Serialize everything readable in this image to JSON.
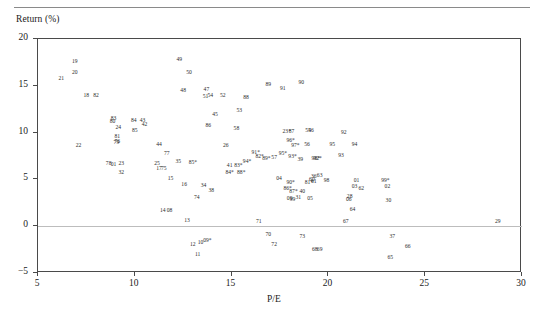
{
  "figure": {
    "axis_label_y": "Return (%)",
    "axis_label_x": "P/E"
  },
  "chart_data": {
    "type": "scatter",
    "title": "",
    "xlabel": "P/E",
    "ylabel": "Return (%)",
    "xlim": [
      5,
      30
    ],
    "ylim": [
      -5,
      20
    ],
    "xticks": [
      "5",
      "10",
      "15",
      "20",
      "25",
      "30"
    ],
    "yticks": [
      "20",
      "15",
      "10",
      "5",
      "0",
      "-5"
    ],
    "grid": false,
    "legend": null,
    "zero_reference_line": 0,
    "point_style": "text-label",
    "note": "Each observation is drawn as its two-character id label; ids ending in * are starred observations.",
    "points": [
      {
        "label": "21",
        "x": 6.25,
        "y": 15.6
      },
      {
        "label": "19",
        "x": 6.95,
        "y": 17.4
      },
      {
        "label": "20",
        "x": 6.95,
        "y": 16.3
      },
      {
        "label": "18",
        "x": 7.55,
        "y": 13.8
      },
      {
        "label": "82",
        "x": 8.05,
        "y": 13.8
      },
      {
        "label": "22",
        "x": 7.15,
        "y": 8.5
      },
      {
        "label": "83",
        "x": 8.95,
        "y": 11.3
      },
      {
        "label": "80",
        "x": 8.9,
        "y": 11.0
      },
      {
        "label": "24",
        "x": 9.2,
        "y": 10.4
      },
      {
        "label": "81",
        "x": 9.15,
        "y": 9.4
      },
      {
        "label": "76",
        "x": 9.15,
        "y": 8.9
      },
      {
        "label": "79",
        "x": 9.1,
        "y": 8.8
      },
      {
        "label": "84",
        "x": 10.0,
        "y": 11.1
      },
      {
        "label": "43",
        "x": 10.45,
        "y": 11.1
      },
      {
        "label": "42",
        "x": 10.55,
        "y": 10.7
      },
      {
        "label": "85",
        "x": 10.05,
        "y": 10.1
      },
      {
        "label": "78",
        "x": 8.7,
        "y": 6.5
      },
      {
        "label": "01",
        "x": 8.95,
        "y": 6.4
      },
      {
        "label": "23",
        "x": 9.35,
        "y": 6.5
      },
      {
        "label": "32",
        "x": 9.35,
        "y": 5.6
      },
      {
        "label": "44",
        "x": 11.3,
        "y": 8.6
      },
      {
        "label": "77",
        "x": 11.7,
        "y": 7.6
      },
      {
        "label": "25",
        "x": 11.2,
        "y": 6.5
      },
      {
        "label": "17",
        "x": 11.3,
        "y": 6.0
      },
      {
        "label": "75",
        "x": 11.55,
        "y": 6.0
      },
      {
        "label": "15",
        "x": 11.9,
        "y": 4.9
      },
      {
        "label": "35",
        "x": 12.3,
        "y": 6.7
      },
      {
        "label": "49",
        "x": 12.35,
        "y": 17.6
      },
      {
        "label": "50",
        "x": 12.85,
        "y": 16.3
      },
      {
        "label": "48",
        "x": 12.55,
        "y": 14.3
      },
      {
        "label": "47",
        "x": 13.75,
        "y": 14.4
      },
      {
        "label": "51",
        "x": 13.7,
        "y": 13.7
      },
      {
        "label": "54",
        "x": 13.95,
        "y": 13.8
      },
      {
        "label": "52",
        "x": 14.6,
        "y": 13.8
      },
      {
        "label": "88",
        "x": 15.8,
        "y": 13.6
      },
      {
        "label": "45",
        "x": 14.2,
        "y": 11.8
      },
      {
        "label": "53",
        "x": 15.45,
        "y": 12.2
      },
      {
        "label": "86",
        "x": 13.85,
        "y": 10.6
      },
      {
        "label": "58",
        "x": 15.3,
        "y": 10.3
      },
      {
        "label": "26",
        "x": 14.75,
        "y": 8.5
      },
      {
        "label": "16",
        "x": 12.6,
        "y": 4.3
      },
      {
        "label": "34",
        "x": 13.6,
        "y": 4.2
      },
      {
        "label": "38",
        "x": 14.0,
        "y": 3.7
      },
      {
        "label": "74",
        "x": 13.25,
        "y": 2.9
      },
      {
        "label": "14",
        "x": 11.5,
        "y": 1.5
      },
      {
        "label": "08",
        "x": 11.85,
        "y": 1.5
      },
      {
        "label": "13",
        "x": 12.75,
        "y": 0.5
      },
      {
        "label": "85*",
        "x": 13.05,
        "y": 6.6
      },
      {
        "label": "41",
        "x": 14.95,
        "y": 6.3
      },
      {
        "label": "83*",
        "x": 15.4,
        "y": 6.3
      },
      {
        "label": "84*",
        "x": 14.95,
        "y": 5.6
      },
      {
        "label": "88*",
        "x": 15.55,
        "y": 5.6
      },
      {
        "label": "94*",
        "x": 15.85,
        "y": 6.8
      },
      {
        "label": "91*",
        "x": 16.3,
        "y": 7.7
      },
      {
        "label": "82*",
        "x": 16.5,
        "y": 7.3
      },
      {
        "label": "89*",
        "x": 16.85,
        "y": 7.1
      },
      {
        "label": "57",
        "x": 17.25,
        "y": 7.2
      },
      {
        "label": "95*",
        "x": 17.7,
        "y": 7.6
      },
      {
        "label": "96*",
        "x": 18.1,
        "y": 9.0
      },
      {
        "label": "97*",
        "x": 18.35,
        "y": 8.5
      },
      {
        "label": "56",
        "x": 18.95,
        "y": 8.6
      },
      {
        "label": "93*",
        "x": 18.2,
        "y": 7.3
      },
      {
        "label": "39",
        "x": 18.6,
        "y": 7.0
      },
      {
        "label": "98*",
        "x": 19.4,
        "y": 7.1
      },
      {
        "label": "92*",
        "x": 19.5,
        "y": 7.1
      },
      {
        "label": "23*",
        "x": 17.9,
        "y": 10.0
      },
      {
        "label": "87",
        "x": 18.15,
        "y": 10.0
      },
      {
        "label": "55",
        "x": 19.0,
        "y": 10.1
      },
      {
        "label": "46",
        "x": 19.15,
        "y": 10.1
      },
      {
        "label": "89",
        "x": 16.95,
        "y": 15.0
      },
      {
        "label": "91",
        "x": 17.7,
        "y": 14.5
      },
      {
        "label": "90",
        "x": 18.65,
        "y": 15.2
      },
      {
        "label": "92",
        "x": 20.85,
        "y": 9.8
      },
      {
        "label": "95",
        "x": 20.25,
        "y": 8.6
      },
      {
        "label": "94",
        "x": 21.4,
        "y": 8.6
      },
      {
        "label": "93",
        "x": 20.7,
        "y": 7.4
      },
      {
        "label": "04",
        "x": 17.5,
        "y": 4.9
      },
      {
        "label": "90*",
        "x": 18.1,
        "y": 4.5
      },
      {
        "label": "86*",
        "x": 17.95,
        "y": 3.9
      },
      {
        "label": "87*",
        "x": 18.25,
        "y": 3.6
      },
      {
        "label": "40",
        "x": 18.7,
        "y": 3.6
      },
      {
        "label": "31",
        "x": 18.5,
        "y": 2.9
      },
      {
        "label": "36",
        "x": 19.3,
        "y": 5.2
      },
      {
        "label": "63",
        "x": 19.6,
        "y": 5.3
      },
      {
        "label": "60",
        "x": 19.2,
        "y": 4.8
      },
      {
        "label": "61",
        "x": 19.3,
        "y": 4.6
      },
      {
        "label": "81*",
        "x": 19.05,
        "y": 4.5
      },
      {
        "label": "98",
        "x": 19.95,
        "y": 4.7
      },
      {
        "label": "05",
        "x": 19.1,
        "y": 2.8
      },
      {
        "label": "09",
        "x": 18.05,
        "y": 2.8
      },
      {
        "label": "99",
        "x": 18.2,
        "y": 2.7
      },
      {
        "label": "01",
        "x": 21.5,
        "y": 4.7
      },
      {
        "label": "03",
        "x": 21.4,
        "y": 4.1
      },
      {
        "label": "62",
        "x": 21.75,
        "y": 3.9
      },
      {
        "label": "28",
        "x": 21.15,
        "y": 3.0
      },
      {
        "label": "06",
        "x": 21.1,
        "y": 2.7
      },
      {
        "label": "64",
        "x": 21.3,
        "y": 1.6
      },
      {
        "label": "99*",
        "x": 23.0,
        "y": 4.7
      },
      {
        "label": "02",
        "x": 23.1,
        "y": 4.1
      },
      {
        "label": "30",
        "x": 23.15,
        "y": 2.6
      },
      {
        "label": "29",
        "x": 28.8,
        "y": 0.35
      },
      {
        "label": "71",
        "x": 16.45,
        "y": 0.3
      },
      {
        "label": "67",
        "x": 20.95,
        "y": 0.3
      },
      {
        "label": "70",
        "x": 16.95,
        "y": -1.1
      },
      {
        "label": "73",
        "x": 18.7,
        "y": -1.3
      },
      {
        "label": "72",
        "x": 17.25,
        "y": -2.1
      },
      {
        "label": "37",
        "x": 23.35,
        "y": -1.3
      },
      {
        "label": "66",
        "x": 24.15,
        "y": -2.3
      },
      {
        "label": "65",
        "x": 23.25,
        "y": -3.5
      },
      {
        "label": "68",
        "x": 19.35,
        "y": -2.6
      },
      {
        "label": "69",
        "x": 19.6,
        "y": -2.6
      },
      {
        "label": "12",
        "x": 13.05,
        "y": -2.1
      },
      {
        "label": "10",
        "x": 13.45,
        "y": -1.9
      },
      {
        "label": "09*",
        "x": 13.8,
        "y": -1.7
      },
      {
        "label": "11",
        "x": 13.3,
        "y": -3.2
      }
    ]
  }
}
